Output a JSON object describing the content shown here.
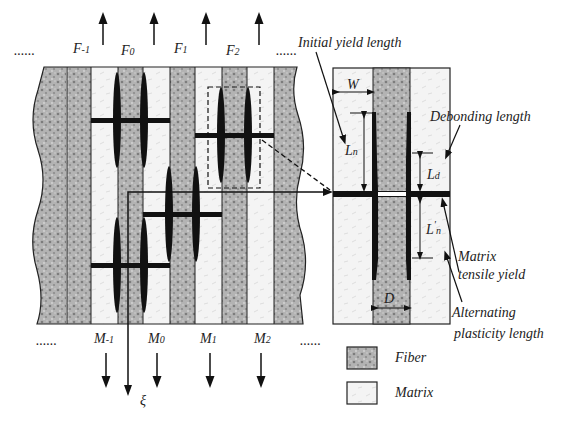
{
  "top_labels": {
    "dots_left": "......",
    "dots_right": "......",
    "fibers": [
      {
        "base": "F",
        "sub": "-1"
      },
      {
        "base": "F",
        "sub": "0"
      },
      {
        "base": "F",
        "sub": "1"
      },
      {
        "base": "F",
        "sub": "2"
      }
    ]
  },
  "bottom_labels": {
    "dots_left": "......",
    "dots_right": "......",
    "matrices": [
      {
        "base": "M",
        "sub": "-1"
      },
      {
        "base": "M",
        "sub": "0"
      },
      {
        "base": "M",
        "sub": "1"
      },
      {
        "base": "M",
        "sub": "2"
      }
    ],
    "axis": "ξ"
  },
  "detail_labels": {
    "initial_yield_length": "Initial yield length",
    "debonding_length": "Debonding length",
    "matrix_tensile_yield_1": "Matrix",
    "matrix_tensile_yield_2": "tensile yield",
    "alternating_1": "Alternating",
    "alternating_2": "plasticity length",
    "W": "W",
    "D": "D",
    "Ln": {
      "base": "L",
      "sub": "n"
    },
    "Ld": {
      "base": "L",
      "sub": "d"
    },
    "Lpn": {
      "base": "L",
      "sup": "'",
      "sub": "n"
    }
  },
  "legend": [
    {
      "label": "Fiber",
      "swatch": "fiber"
    },
    {
      "label": "Matrix",
      "swatch": "matrix"
    }
  ],
  "colors": {
    "fiber": "#a9a9a9",
    "matrix": "#f1f1f1",
    "ink": "#111111"
  }
}
